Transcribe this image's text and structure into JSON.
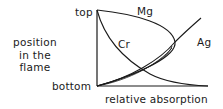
{
  "diagram": {
    "y_axis_label": [
      "position",
      "in the",
      "flame"
    ],
    "y_axis_top": "top",
    "y_axis_bottom": "bottom",
    "x_axis_label": "relative absorption",
    "curves": [
      {
        "name": "Mg",
        "label": "Mg",
        "shape": "rises from top, bulges right to max absorption mid-flame, returns to bottom at low absorption"
      },
      {
        "name": "Cr",
        "label": "Cr",
        "shape": "high absorption at top, decreases toward bottom of flame"
      },
      {
        "name": "Ag",
        "label": "Ag",
        "shape": "low absorption at bottom, increasing monotonically toward top"
      }
    ],
    "line_color": "#1a1a1a"
  }
}
